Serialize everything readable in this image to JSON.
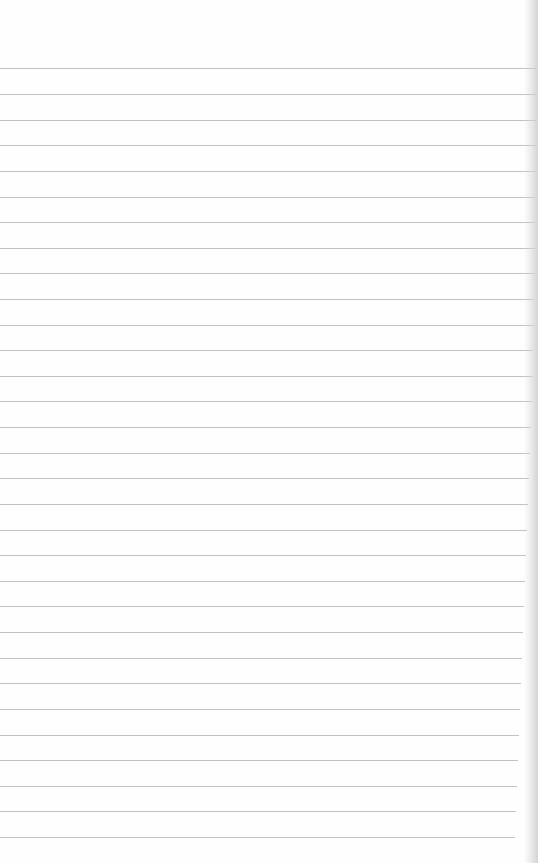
{
  "page": {
    "type": "lined-paper",
    "background_color": "#fefefe",
    "rule_color": "#b9b9b9",
    "rule_count": 31,
    "first_rule_y": 68,
    "rule_spacing": 25.63,
    "rules": [
      {
        "y": 68,
        "right": 536
      },
      {
        "y": 94,
        "right": 536
      },
      {
        "y": 120,
        "right": 536
      },
      {
        "y": 145,
        "right": 536
      },
      {
        "y": 171,
        "right": 536
      },
      {
        "y": 197,
        "right": 535
      },
      {
        "y": 222,
        "right": 535
      },
      {
        "y": 248,
        "right": 535
      },
      {
        "y": 273,
        "right": 535
      },
      {
        "y": 299,
        "right": 534
      },
      {
        "y": 325,
        "right": 534
      },
      {
        "y": 350,
        "right": 533
      },
      {
        "y": 376,
        "right": 533
      },
      {
        "y": 401,
        "right": 532
      },
      {
        "y": 427,
        "right": 531
      },
      {
        "y": 453,
        "right": 530
      },
      {
        "y": 478,
        "right": 529
      },
      {
        "y": 504,
        "right": 528
      },
      {
        "y": 530,
        "right": 527
      },
      {
        "y": 555,
        "right": 526
      },
      {
        "y": 581,
        "right": 525
      },
      {
        "y": 606,
        "right": 524
      },
      {
        "y": 632,
        "right": 523
      },
      {
        "y": 658,
        "right": 522
      },
      {
        "y": 683,
        "right": 521
      },
      {
        "y": 709,
        "right": 520
      },
      {
        "y": 735,
        "right": 519
      },
      {
        "y": 760,
        "right": 518
      },
      {
        "y": 786,
        "right": 517
      },
      {
        "y": 811,
        "right": 516
      },
      {
        "y": 837,
        "right": 515
      }
    ]
  }
}
